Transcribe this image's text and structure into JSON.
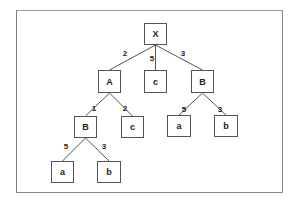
{
  "diagram": {
    "type": "tree",
    "nodes": [
      {
        "id": "X",
        "label": "X",
        "x": 144,
        "y": 23,
        "w": 23,
        "h": 22
      },
      {
        "id": "A",
        "label": "A",
        "x": 98,
        "y": 70,
        "w": 23,
        "h": 23
      },
      {
        "id": "c1",
        "label": "c",
        "x": 144,
        "y": 70,
        "w": 23,
        "h": 23
      },
      {
        "id": "B1",
        "label": "B",
        "x": 191,
        "y": 70,
        "w": 23,
        "h": 23
      },
      {
        "id": "B2",
        "label": "B",
        "x": 74,
        "y": 116,
        "w": 23,
        "h": 22
      },
      {
        "id": "c2",
        "label": "c",
        "x": 121,
        "y": 116,
        "w": 23,
        "h": 22
      },
      {
        "id": "a1",
        "label": "a",
        "x": 167,
        "y": 115,
        "w": 24,
        "h": 22
      },
      {
        "id": "b1",
        "label": "b",
        "x": 214,
        "y": 115,
        "w": 24,
        "h": 22
      },
      {
        "id": "a2",
        "label": "a",
        "x": 51,
        "y": 161,
        "w": 23,
        "h": 22
      },
      {
        "id": "b2",
        "label": "b",
        "x": 97,
        "y": 161,
        "w": 24,
        "h": 22
      }
    ],
    "edges": [
      {
        "from": "X",
        "to": "A",
        "weight": "2",
        "lx": 125,
        "ly": 54
      },
      {
        "from": "X",
        "to": "c1",
        "weight": "5",
        "lx": 152,
        "ly": 59
      },
      {
        "from": "X",
        "to": "B1",
        "weight": "3",
        "lx": 183,
        "ly": 54
      },
      {
        "from": "A",
        "to": "B2",
        "weight": "1",
        "lx": 94,
        "ly": 109
      },
      {
        "from": "A",
        "to": "c2",
        "weight": "2",
        "lx": 125,
        "ly": 109
      },
      {
        "from": "B1",
        "to": "a1",
        "weight": "5",
        "lx": 184,
        "ly": 110
      },
      {
        "from": "B1",
        "to": "b1",
        "weight": "3",
        "lx": 220,
        "ly": 110
      },
      {
        "from": "B2",
        "to": "a2",
        "weight": "5",
        "lx": 66,
        "ly": 147
      },
      {
        "from": "B2",
        "to": "b2",
        "weight": "3",
        "lx": 104,
        "ly": 147
      }
    ]
  },
  "labels": {
    "X": "X",
    "A": "A",
    "c1": "c",
    "B1": "B",
    "B2": "B",
    "c2": "c",
    "a1": "a",
    "b1": "b",
    "a2": "a",
    "b2": "b",
    "w_X_A": "2",
    "w_X_c1": "5",
    "w_X_B1": "3",
    "w_A_B2": "1",
    "w_A_c2": "2",
    "w_B1_a1": "5",
    "w_B1_b1": "3",
    "w_B2_a2": "5",
    "w_B2_b2": "3"
  },
  "colors": {
    "frame": "#8a8a8a",
    "edge": "#555555",
    "node_border": "#555555",
    "text": "#222222",
    "background": "#ffffff"
  }
}
